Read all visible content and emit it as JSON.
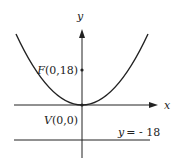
{
  "diagram": {
    "type": "parabola",
    "axes": {
      "x_label": "x",
      "y_label": "y"
    },
    "focus": {
      "name": "F",
      "coords": "(0,18)",
      "label": "F(0,18)"
    },
    "vertex": {
      "name": "V",
      "coords": "(0,0)",
      "label": "V(0,0)"
    },
    "directrix": {
      "label_lhs": "y",
      "label_rhs": "= - 18",
      "equation": "y = -18"
    },
    "colors": {
      "stroke": "#222222",
      "background": "#ffffff"
    }
  }
}
